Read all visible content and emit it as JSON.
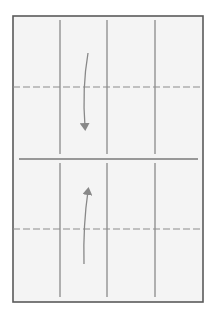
{
  "diagram": {
    "type": "origami-fold-step",
    "colors": {
      "background": "#ffffff",
      "paper": "#f4f4f4",
      "border": "#5a5a5a",
      "crease": "#8a8a8a",
      "valley_fold": "#8c8c8c",
      "arrow": "#888888"
    },
    "paper": {
      "x": 13,
      "y": 16,
      "width": 190,
      "height": 286
    },
    "vertical_creases": [
      {
        "x": 60,
        "segments": [
          [
            20,
            154
          ],
          [
            163,
            297
          ]
        ]
      },
      {
        "x": 107,
        "segments": [
          [
            20,
            154
          ],
          [
            163,
            297
          ]
        ]
      },
      {
        "x": 155,
        "segments": [
          [
            20,
            154
          ],
          [
            163,
            297
          ]
        ]
      }
    ],
    "center_line": {
      "y": 159,
      "x1": 19,
      "x2": 198
    },
    "valley_folds": [
      {
        "y": 87,
        "x1": 13,
        "x2": 203,
        "dash": "7 3"
      },
      {
        "y": 229,
        "x1": 13,
        "x2": 203,
        "dash": "7 3"
      }
    ],
    "arrows": [
      {
        "name": "fold-down-arrow",
        "from": [
          88,
          53
        ],
        "ctrl": [
          82,
          88
        ],
        "to": [
          85,
          127
        ],
        "direction": "down"
      },
      {
        "name": "fold-up-arrow",
        "from": [
          84,
          264
        ],
        "ctrl": [
          83,
          225
        ],
        "to": [
          88,
          191
        ],
        "direction": "up"
      }
    ]
  }
}
